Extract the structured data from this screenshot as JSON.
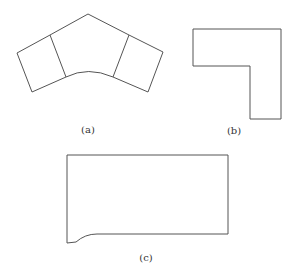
{
  "figure": {
    "panels": [
      {
        "id": "a",
        "label": "(a)",
        "description": "Curved bent segment composed of three blocks"
      },
      {
        "id": "b",
        "label": "(b)",
        "description": "L-shaped polygon"
      },
      {
        "id": "c",
        "label": "(c)",
        "description": "Rectangle with curved fillet at lower-left"
      }
    ],
    "stroke_color": "#555555",
    "background": "#ffffff"
  }
}
